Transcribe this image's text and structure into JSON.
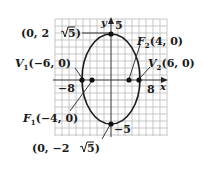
{
  "figure": {
    "type": "ellipse-graph",
    "colors": {
      "grid": "#b9b9b9",
      "axis": "#333333",
      "curve": "#1a1a1a",
      "point": "#111111",
      "text": "#1a1a1a",
      "background": "#ffffff"
    },
    "axes": {
      "x_label": "x",
      "y_label": "y",
      "x_tick_neg": "−8",
      "x_tick_pos": "8",
      "y_tick_pos": "5",
      "y_tick_neg": "−5"
    },
    "points": {
      "top_vertex": {
        "name": "",
        "coords": "(0, 2√5)",
        "text": "(0, 2",
        "radicand": "5",
        "close": ")"
      },
      "bottom_vertex": {
        "name": "",
        "text": "(0, −2",
        "radicand": "5",
        "close": ")"
      },
      "f1": {
        "name": "F",
        "sub": "1",
        "coords": "(−4, 0)"
      },
      "f2": {
        "name": "F",
        "sub": "2",
        "coords": "(4, 0)"
      },
      "v1": {
        "name": "V",
        "sub": "1",
        "coords": "(−6, 0)"
      },
      "v2": {
        "name": "V",
        "sub": "2",
        "coords": "(6, 0)"
      }
    }
  }
}
